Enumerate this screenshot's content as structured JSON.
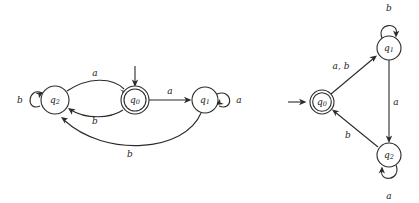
{
  "figure": {
    "stroke_color": "#2b2b2b",
    "background_color": "#ffffff",
    "alphabet": [
      "a",
      "b"
    ]
  },
  "automata": [
    {
      "id": "left",
      "name": "left-automaton",
      "layout": "linear",
      "start_state": "q0",
      "accepting_states": [
        "q0"
      ],
      "states": [
        {
          "id": "q2",
          "label": "q",
          "subscript": "2",
          "cx": 55,
          "cy": 100,
          "r": 14,
          "accepting": false,
          "start": false
        },
        {
          "id": "q0",
          "label": "q",
          "subscript": "0",
          "cx": 135,
          "cy": 100,
          "r": 14,
          "accepting": true,
          "start": true
        },
        {
          "id": "q1",
          "label": "q",
          "subscript": "1",
          "cx": 205,
          "cy": 100,
          "r": 13,
          "accepting": false,
          "start": false
        }
      ],
      "transitions": [
        {
          "from": "q2",
          "to": "q2",
          "label": "b",
          "kind": "self-loop",
          "label_x": 20,
          "label_y": 100
        },
        {
          "from": "q2",
          "to": "q0",
          "label": "a",
          "kind": "curve-top",
          "label_x": 95,
          "label_y": 73
        },
        {
          "from": "q0",
          "to": "q2",
          "label": "b",
          "kind": "curve-bottom",
          "label_x": 95,
          "label_y": 121
        },
        {
          "from": "q0",
          "to": "q1",
          "label": "a",
          "kind": "straight",
          "label_x": 170,
          "label_y": 91
        },
        {
          "from": "q1",
          "to": "q1",
          "label": "a",
          "kind": "self-loop",
          "label_x": 239,
          "label_y": 100
        },
        {
          "from": "q1",
          "to": "q2",
          "label": "b",
          "kind": "long-arc-bottom",
          "label_x": 130,
          "label_y": 154
        }
      ]
    },
    {
      "id": "right",
      "name": "right-automaton",
      "layout": "triangular",
      "start_state": "q0",
      "accepting_states": [
        "q0"
      ],
      "states": [
        {
          "id": "q0",
          "label": "q",
          "subscript": "0",
          "cx": 322,
          "cy": 102,
          "r": 12,
          "accepting": true,
          "start": true
        },
        {
          "id": "q1",
          "label": "q",
          "subscript": "1",
          "cx": 389,
          "cy": 48,
          "r": 12,
          "accepting": false,
          "start": false
        },
        {
          "id": "q2",
          "label": "q",
          "subscript": "2",
          "cx": 389,
          "cy": 155,
          "r": 12,
          "accepting": false,
          "start": false
        }
      ],
      "transitions": [
        {
          "from": "q0",
          "to": "q1",
          "label": "a, b",
          "kind": "straight",
          "label_x": 341,
          "label_y": 66
        },
        {
          "from": "q1",
          "to": "q1",
          "label": "b",
          "kind": "self-loop-top",
          "label_x": 389,
          "label_y": 8
        },
        {
          "from": "q1",
          "to": "q2",
          "label": "a",
          "kind": "straight",
          "label_x": 395,
          "label_y": 102
        },
        {
          "from": "q2",
          "to": "q0",
          "label": "b",
          "kind": "straight",
          "label_x": 348,
          "label_y": 135
        },
        {
          "from": "q2",
          "to": "q2",
          "label": "a",
          "kind": "self-loop-bottom",
          "label_x": 389,
          "label_y": 196
        }
      ]
    }
  ]
}
